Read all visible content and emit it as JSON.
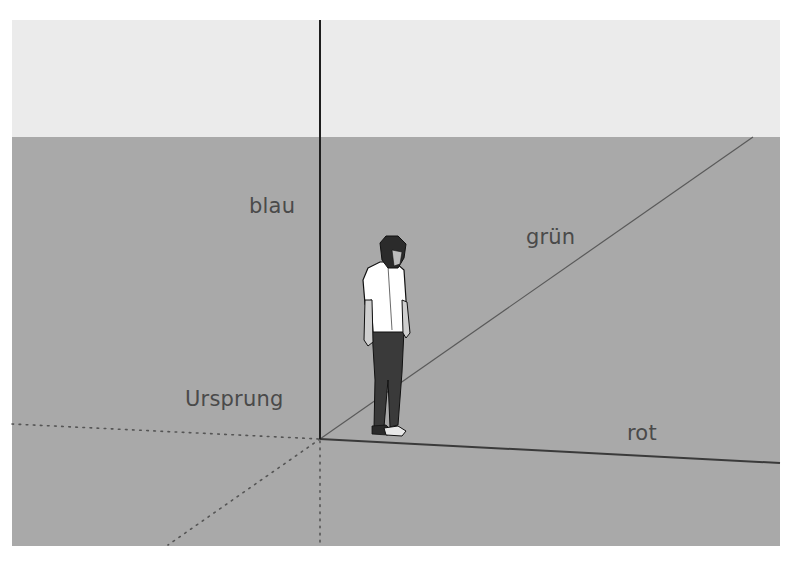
{
  "scene": {
    "description": "SketchUp 3D axes with person figure",
    "colors": {
      "sky": "#ebebeb",
      "ground": "#a9a9a9",
      "axis_blue": "#1e1e1e",
      "axis_red": "#3a3a3a",
      "axis_green": "#5a5a5a",
      "dotted": "#555555",
      "label": "#4a4a4a"
    }
  },
  "labels": {
    "blue": "blau",
    "green": "grün",
    "origin": "Ursprung",
    "red": "rot"
  }
}
